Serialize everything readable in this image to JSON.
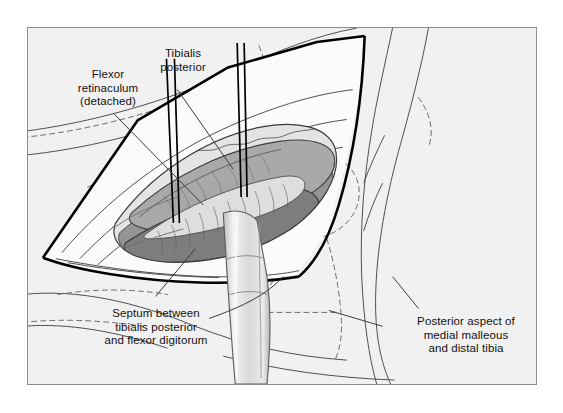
{
  "figure": {
    "background_color": "#ffffff",
    "panel_color": "#f1f1f1",
    "panel_border_color": "#8c8c8c"
  },
  "labels": {
    "flexor_retinaculum": "Flexor\nretinaculum\n(detached)",
    "tibialis_posterior": "Tibialis\nposterior",
    "septum": "Septum between\ntibialis posterior\nand flexor digitorum",
    "posterior_aspect": "Posterior aspect of\nmedial malleous\nand distal tibia"
  },
  "palette": {
    "ink": "#111111",
    "outline_heavy": "#000000",
    "outline_light": "#4f4f4f",
    "tendon_dark": "#7d7d7d",
    "tendon_mid": "#a9a9a9",
    "tendon_light": "#c9c9c9",
    "tissue_pale": "#e4e4e4",
    "flap_fill": "#fbfbfb",
    "retractor": "#dcdcdc",
    "dashed": "#6a6a6a"
  }
}
